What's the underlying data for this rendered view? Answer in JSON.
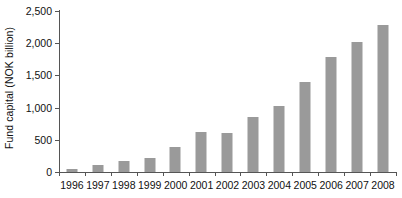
{
  "chart_data": {
    "type": "bar",
    "title": "",
    "xlabel": "",
    "ylabel": "Fund capital (NOK billion)",
    "categories": [
      "1996",
      "1997",
      "1998",
      "1999",
      "2000",
      "2001",
      "2002",
      "2003",
      "2004",
      "2005",
      "2006",
      "2007",
      "2008"
    ],
    "values": [
      45,
      110,
      170,
      220,
      390,
      615,
      610,
      855,
      1020,
      1400,
      1790,
      2020,
      2280
    ],
    "ylim": [
      0,
      2500
    ],
    "yticks": [
      0,
      500,
      1000,
      1500,
      2000,
      2500
    ],
    "ytick_labels": [
      "0",
      "500",
      "1,000",
      "1,500",
      "2,000",
      "2,500"
    ],
    "grid": false,
    "legend": false,
    "legend_position": "none",
    "bar_color": "#9a9a9a",
    "axis_color": "#555555",
    "background_color": "#ffffff"
  }
}
